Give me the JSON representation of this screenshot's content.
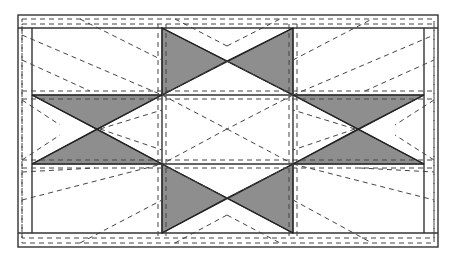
{
  "diagram": {
    "colors": {
      "shade": "#8e8e8e",
      "line": "#333333",
      "dash": "#444444",
      "background": "#ffffff"
    },
    "outer_frame": {
      "x1": 18,
      "y1": 15,
      "x2": 438,
      "y2": 247
    },
    "inner_frame": {
      "x1": 32,
      "y1": 28,
      "x2": 424,
      "y2": 233
    },
    "grid": {
      "columns_x": [
        32,
        162,
        293,
        424
      ],
      "rows_y": [
        28,
        95,
        164,
        233
      ]
    },
    "shaded_units": [
      {
        "name": "top-hourglass",
        "cell": "top-center"
      },
      {
        "name": "bottom-hourglass",
        "cell": "bottom-center"
      },
      {
        "name": "left-hourglass",
        "cell": "middle-left"
      },
      {
        "name": "right-hourglass",
        "cell": "middle-right"
      }
    ]
  }
}
